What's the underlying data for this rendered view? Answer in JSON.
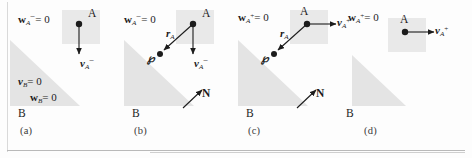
{
  "figure": {
    "background_color": "#fdfdfd",
    "body_fill": "#e9e9e9",
    "incline_fill": "#e4e4e4",
    "stroke_color": "#1c1c1c"
  },
  "panels": [
    {
      "id": "a",
      "caption": "(a)",
      "labels": {
        "wa": "w",
        "wa_sub": "A",
        "wa_sup": "−",
        "wa_eq": "= 0",
        "body_a": "A",
        "body_b": "B",
        "va": "v",
        "va_sub": "A",
        "va_sup": "−",
        "vb": "v",
        "vb_sub": "B",
        "vb_eq": "= 0",
        "wb": "w",
        "wb_sub": "B",
        "wb_eq": "= 0"
      },
      "vectors": [
        {
          "name": "v_A_minus",
          "direction": "down",
          "from": [
            79,
            32
          ],
          "to": [
            79,
            62
          ]
        }
      ],
      "shapes": {
        "square": [
          62,
          18,
          38,
          34
        ],
        "triangle": "right-triangle-lower-left"
      }
    },
    {
      "id": "b",
      "caption": "(b)",
      "labels": {
        "wa": "w",
        "wa_sub": "A",
        "wa_sup": "−",
        "wa_eq": "= 0",
        "body_a": "A",
        "body_b": "B",
        "va": "v",
        "va_sub": "A",
        "va_sup": "−",
        "ra": "r",
        "ra_sub": "A",
        "point_p": "℘",
        "normal": "N"
      },
      "vectors": [
        {
          "name": "v_A_minus",
          "direction": "down",
          "from": [
            79,
            32
          ],
          "to": [
            79,
            62
          ]
        },
        {
          "name": "r_A",
          "direction": "down-left",
          "from": [
            79,
            32
          ],
          "to": [
            48,
            58
          ]
        },
        {
          "name": "N",
          "direction": "up-right",
          "from": [
            74,
            118
          ],
          "to": [
            93,
            100
          ]
        }
      ]
    },
    {
      "id": "c",
      "caption": "(c)",
      "labels": {
        "wa": "w",
        "wa_sub": "A",
        "wa_sup": "+",
        "wa_eq": "= 0",
        "body_a": "A",
        "body_b": "B",
        "va": "v",
        "va_sub": "A",
        "va_sup": "+",
        "ra": "r",
        "ra_sub": "A",
        "point_p": "℘",
        "normal": "N"
      },
      "vectors": [
        {
          "name": "v_A_plus",
          "direction": "right",
          "from": [
            79,
            32
          ],
          "to": [
            110,
            32
          ]
        },
        {
          "name": "r_A",
          "direction": "down-left",
          "from": [
            79,
            32
          ],
          "to": [
            48,
            58
          ]
        },
        {
          "name": "N",
          "direction": "up-right",
          "from": [
            74,
            118
          ],
          "to": [
            93,
            100
          ]
        }
      ]
    },
    {
      "id": "d",
      "caption": "(d)",
      "labels": {
        "wa": "w",
        "wa_sub": "A",
        "wa_sup": "+",
        "wa_eq": "= 0",
        "body_a": "A",
        "body_b": "B",
        "va": "v",
        "va_sub": "A",
        "va_sup": "+"
      },
      "vectors": [
        {
          "name": "v_A_plus",
          "direction": "right",
          "from": [
            79,
            40
          ],
          "to": [
            110,
            40
          ]
        }
      ]
    }
  ]
}
